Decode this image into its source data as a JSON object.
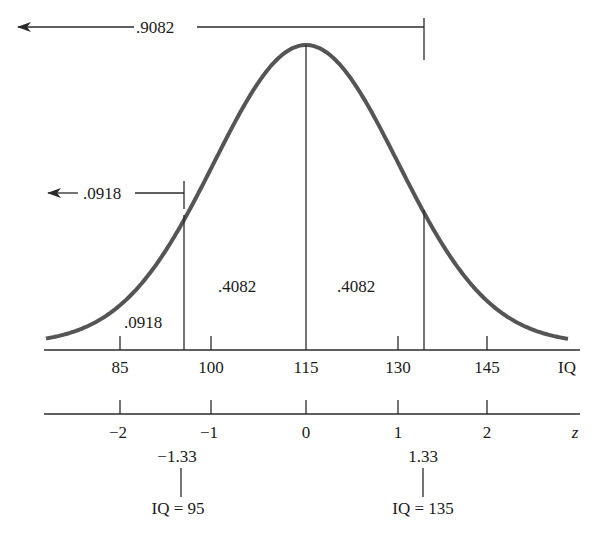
{
  "colors": {
    "curve": "#555555",
    "lines": "#2a2a2a",
    "text": "#1a1a1a",
    "background": "#ffffff"
  },
  "top_bracket": {
    "label": ".9082",
    "direction": "left-arrow",
    "ends_at": "IQ = 135"
  },
  "left_bracket": {
    "label": ".0918",
    "direction": "left-arrow",
    "ends_at": "IQ = 95"
  },
  "regions": {
    "left_tail": ".0918",
    "left_center": ".4082",
    "right_center": ".4082"
  },
  "iq_axis": {
    "label": "IQ",
    "ticks": [
      "85",
      "100",
      "115",
      "130",
      "145"
    ]
  },
  "z_axis": {
    "label": "z",
    "ticks": [
      "−2",
      "−1",
      "0",
      "1",
      "2"
    ]
  },
  "annotations": {
    "left": {
      "z": "−1.33",
      "iq": "IQ = 95"
    },
    "right": {
      "z": "1.33",
      "iq": "IQ = 135"
    }
  }
}
